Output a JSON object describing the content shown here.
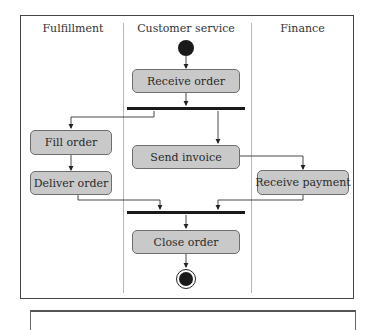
{
  "diagram": {
    "type": "UML activity diagram with swimlanes",
    "lanes": [
      {
        "label": "Fulfillment"
      },
      {
        "label": "Customer service"
      },
      {
        "label": "Finance"
      }
    ],
    "nodes": {
      "receive_order": "Receive order",
      "fill_order": "Fill order",
      "deliver_order": "Deliver order",
      "send_invoice": "Send invoice",
      "receive_payment": "Receive payment",
      "close_order": "Close order"
    },
    "edges": [
      {
        "from": "start",
        "to": "Receive order"
      },
      {
        "from": "Receive order",
        "to": "fork"
      },
      {
        "from": "fork",
        "to": "Fill order"
      },
      {
        "from": "fork",
        "to": "Send invoice"
      },
      {
        "from": "Fill order",
        "to": "Deliver order"
      },
      {
        "from": "Send invoice",
        "to": "Receive payment"
      },
      {
        "from": "Deliver order",
        "to": "join"
      },
      {
        "from": "Receive payment",
        "to": "join"
      },
      {
        "from": "join",
        "to": "Close order"
      },
      {
        "from": "Close order",
        "to": "end"
      }
    ],
    "colors": {
      "node_fill": "#c9c9c9",
      "node_border": "#6e6e6e",
      "bar": "#1a1a1a",
      "frame": "#444444"
    }
  }
}
